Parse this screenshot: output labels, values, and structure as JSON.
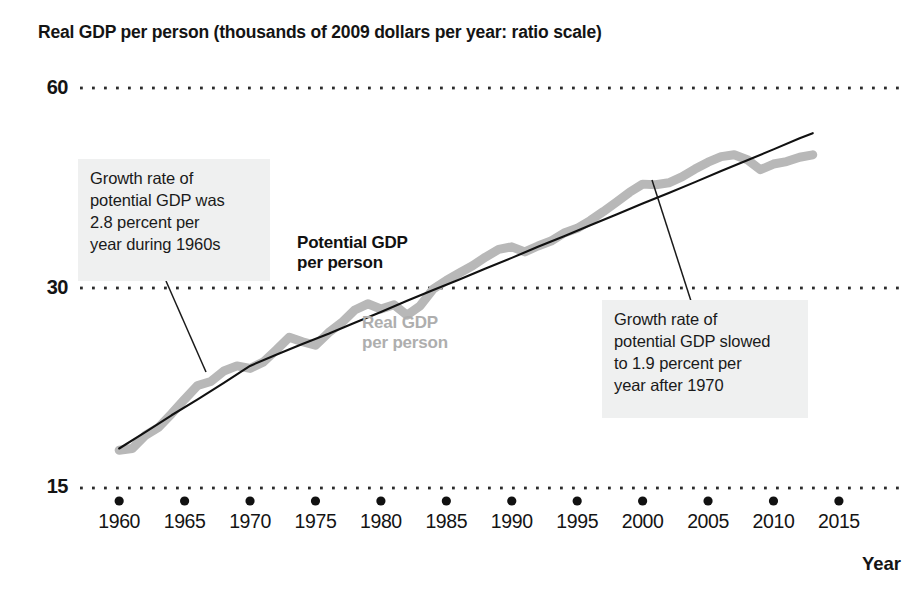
{
  "chart_data": {
    "type": "line",
    "title": "Real GDP per person (thousands of 2009 dollars per year: ratio scale)",
    "xlabel": "Year",
    "ylabel": "",
    "scale": "ratio (logarithmic)",
    "grid": "dotted horizontal gridlines at 15, 30, 60",
    "legend_position": "inline labels on curves",
    "xlim": [
      1958,
      2016
    ],
    "ylim": [
      13.5,
      64
    ],
    "y_ticks": [
      15,
      30,
      60
    ],
    "y_tick_labels": [
      "15",
      "30",
      "60"
    ],
    "x_ticks": [
      1960,
      1965,
      1970,
      1975,
      1980,
      1985,
      1990,
      1995,
      2000,
      2005,
      2010,
      2015
    ],
    "x_tick_labels": [
      "1960",
      "1965",
      "1970",
      "1975",
      "1980",
      "1985",
      "1990",
      "1995",
      "2000",
      "2005",
      "2010",
      "2015"
    ],
    "series": [
      {
        "name": "Potential GDP per person",
        "color": "#111111",
        "style": "thin solid black line",
        "x": [
          1960,
          1962,
          1964,
          1966,
          1968,
          1970,
          1972,
          1974,
          1976,
          1978,
          1980,
          1982,
          1984,
          1986,
          1988,
          1990,
          1992,
          1994,
          1996,
          1998,
          2000,
          2002,
          2004,
          2006,
          2008,
          2010,
          2012,
          2013
        ],
        "values": [
          17.2,
          18.2,
          19.3,
          20.4,
          21.6,
          22.9,
          23.8,
          24.7,
          25.6,
          26.6,
          27.6,
          28.7,
          29.8,
          30.9,
          32.1,
          33.3,
          34.6,
          35.9,
          37.3,
          38.7,
          40.2,
          41.7,
          43.3,
          45.0,
          46.7,
          48.5,
          50.4,
          51.3
        ]
      },
      {
        "name": "Real GDP per person",
        "color": "#b8b8b8",
        "style": "thick gray line",
        "x": [
          1960,
          1961,
          1962,
          1963,
          1964,
          1965,
          1966,
          1967,
          1968,
          1969,
          1970,
          1971,
          1972,
          1973,
          1974,
          1975,
          1976,
          1977,
          1978,
          1979,
          1980,
          1981,
          1982,
          1983,
          1984,
          1985,
          1986,
          1987,
          1988,
          1989,
          1990,
          1991,
          1992,
          1993,
          1994,
          1995,
          1996,
          1997,
          1998,
          1999,
          2000,
          2001,
          2002,
          2003,
          2004,
          2005,
          2006,
          2007,
          2008,
          2009,
          2010,
          2011,
          2012,
          2013
        ],
        "values": [
          17.1,
          17.2,
          18.0,
          18.5,
          19.4,
          20.4,
          21.4,
          21.7,
          22.5,
          22.9,
          22.7,
          23.2,
          24.2,
          25.3,
          24.9,
          24.6,
          25.7,
          26.6,
          27.8,
          28.4,
          27.9,
          28.3,
          27.3,
          28.2,
          29.9,
          30.8,
          31.6,
          32.4,
          33.4,
          34.3,
          34.6,
          34.0,
          34.7,
          35.3,
          36.3,
          36.9,
          37.9,
          39.1,
          40.4,
          41.8,
          43.0,
          42.9,
          43.2,
          44.1,
          45.3,
          46.4,
          47.3,
          47.6,
          46.8,
          45.2,
          46.1,
          46.5,
          47.2,
          47.6
        ]
      }
    ],
    "annotations": [
      {
        "id": "left-note",
        "lines": [
          "Growth rate of",
          "potential GDP was",
          "2.8 percent per",
          "year during 1960s"
        ],
        "points_to_year": 1965,
        "leader": true
      },
      {
        "id": "right-note",
        "lines": [
          "Growth rate of",
          "potential GDP slowed",
          "to 1.9 percent per",
          "year after 1970"
        ],
        "points_to_year": 2000,
        "leader": true
      }
    ]
  },
  "title": {
    "text": "Real GDP per person (thousands of 2009 dollars per year: ratio scale)"
  },
  "axes": {
    "y_labels": [
      "60",
      "30",
      "15"
    ],
    "x_labels": [
      "1960",
      "1965",
      "1970",
      "1975",
      "1980",
      "1985",
      "1990",
      "1995",
      "2000",
      "2005",
      "2010",
      "2015"
    ],
    "x_axis_name": "Year"
  },
  "series_labels": {
    "potential": "Potential GDP\nper person",
    "potential_line1": "Potential GDP",
    "potential_line2": "per person",
    "real_line1": "Real GDP",
    "real_line2": "per person"
  },
  "annotations": {
    "left": "Growth rate of potential GDP was 2.8 percent per year during 1960s",
    "left_line1": "Growth rate of",
    "left_line2": "potential GDP was",
    "left_line3": "2.8 percent per",
    "left_line4": "year during 1960s",
    "right": "Growth rate of potential GDP slowed to 1.9 percent per year after 1970",
    "right_line1": "Growth rate of",
    "right_line2": "potential GDP slowed",
    "right_line3": "to 1.9 percent per",
    "right_line4": "year after 1970"
  },
  "colors": {
    "potential_line": "#111111",
    "real_line": "#b8b8b8",
    "gridline": "#2b2b2b",
    "annotation_bg": "#eff0f0",
    "text": "#141414"
  }
}
